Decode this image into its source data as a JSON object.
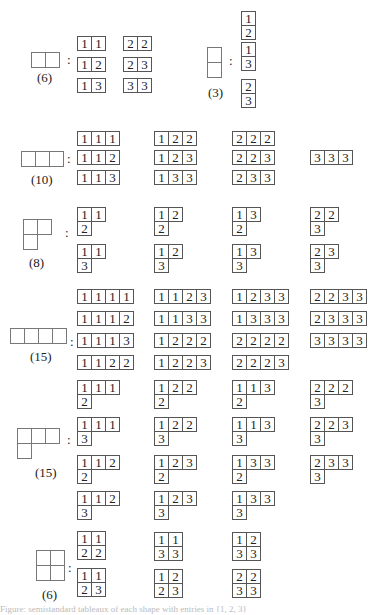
{
  "groups": [
    {
      "id": "shape-2",
      "shape": [
        2
      ],
      "count_label": "(6)",
      "tableaux": [
        [
          [
            "1",
            "1"
          ]
        ],
        [
          [
            "1",
            "2"
          ]
        ],
        [
          [
            "1",
            "3"
          ]
        ],
        [
          [
            "2",
            "2"
          ]
        ],
        [
          [
            "2",
            "3"
          ]
        ],
        [
          [
            "3",
            "3"
          ]
        ]
      ]
    },
    {
      "id": "shape-1-1",
      "shape": [
        1,
        1
      ],
      "count_label": "(3)",
      "tableaux": [
        [
          [
            "1"
          ],
          [
            "2"
          ]
        ],
        [
          [
            "1"
          ],
          [
            "3"
          ]
        ],
        [
          [
            "2"
          ],
          [
            "3"
          ]
        ]
      ]
    },
    {
      "id": "shape-3",
      "shape": [
        3
      ],
      "count_label": "(10)",
      "tableaux": [
        [
          [
            "1",
            "1",
            "1"
          ]
        ],
        [
          [
            "1",
            "1",
            "2"
          ]
        ],
        [
          [
            "1",
            "1",
            "3"
          ]
        ],
        [
          [
            "1",
            "2",
            "2"
          ]
        ],
        [
          [
            "1",
            "2",
            "3"
          ]
        ],
        [
          [
            "1",
            "3",
            "3"
          ]
        ],
        [
          [
            "2",
            "2",
            "2"
          ]
        ],
        [
          [
            "2",
            "2",
            "3"
          ]
        ],
        [
          [
            "2",
            "3",
            "3"
          ]
        ],
        [
          [
            "3",
            "3",
            "3"
          ]
        ]
      ]
    },
    {
      "id": "shape-2-1",
      "shape": [
        2,
        1
      ],
      "count_label": "(8)",
      "tableaux": [
        [
          [
            "1",
            "1"
          ],
          [
            "2"
          ]
        ],
        [
          [
            "1",
            "1"
          ],
          [
            "3"
          ]
        ],
        [
          [
            "1",
            "2"
          ],
          [
            "2"
          ]
        ],
        [
          [
            "1",
            "2"
          ],
          [
            "3"
          ]
        ],
        [
          [
            "1",
            "3"
          ],
          [
            "2"
          ]
        ],
        [
          [
            "1",
            "3"
          ],
          [
            "3"
          ]
        ],
        [
          [
            "2",
            "2"
          ],
          [
            "3"
          ]
        ],
        [
          [
            "2",
            "3"
          ],
          [
            "3"
          ]
        ]
      ]
    },
    {
      "id": "shape-4",
      "shape": [
        4
      ],
      "count_label": "(15)",
      "tableaux": [
        [
          [
            "1",
            "1",
            "1",
            "1"
          ]
        ],
        [
          [
            "1",
            "1",
            "1",
            "2"
          ]
        ],
        [
          [
            "1",
            "1",
            "1",
            "3"
          ]
        ],
        [
          [
            "1",
            "1",
            "2",
            "2"
          ]
        ],
        [
          [
            "1",
            "1",
            "2",
            "3"
          ]
        ],
        [
          [
            "1",
            "1",
            "3",
            "3"
          ]
        ],
        [
          [
            "1",
            "2",
            "2",
            "2"
          ]
        ],
        [
          [
            "1",
            "2",
            "2",
            "3"
          ]
        ],
        [
          [
            "1",
            "2",
            "3",
            "3"
          ]
        ],
        [
          [
            "1",
            "3",
            "3",
            "3"
          ]
        ],
        [
          [
            "2",
            "2",
            "2",
            "2"
          ]
        ],
        [
          [
            "2",
            "2",
            "2",
            "3"
          ]
        ],
        [
          [
            "2",
            "2",
            "3",
            "3"
          ]
        ],
        [
          [
            "2",
            "3",
            "3",
            "3"
          ]
        ],
        [
          [
            "3",
            "3",
            "3",
            "3"
          ]
        ]
      ]
    },
    {
      "id": "shape-3-1",
      "shape": [
        3,
        1
      ],
      "count_label": "(15)",
      "tableaux": [
        [
          [
            "1",
            "1",
            "1"
          ],
          [
            "2"
          ]
        ],
        [
          [
            "1",
            "1",
            "1"
          ],
          [
            "3"
          ]
        ],
        [
          [
            "1",
            "1",
            "2"
          ],
          [
            "2"
          ]
        ],
        [
          [
            "1",
            "1",
            "2"
          ],
          [
            "3"
          ]
        ],
        [
          [
            "1",
            "2",
            "2"
          ],
          [
            "2"
          ]
        ],
        [
          [
            "1",
            "2",
            "2"
          ],
          [
            "3"
          ]
        ],
        [
          [
            "1",
            "2",
            "3"
          ],
          [
            "2"
          ]
        ],
        [
          [
            "1",
            "2",
            "3"
          ],
          [
            "3"
          ]
        ],
        [
          [
            "1",
            "1",
            "3"
          ],
          [
            "2"
          ]
        ],
        [
          [
            "1",
            "1",
            "3"
          ],
          [
            "3"
          ]
        ],
        [
          [
            "1",
            "3",
            "3"
          ],
          [
            "2"
          ]
        ],
        [
          [
            "1",
            "3",
            "3"
          ],
          [
            "3"
          ]
        ],
        [
          [
            "2",
            "2",
            "2"
          ],
          [
            "3"
          ]
        ],
        [
          [
            "2",
            "2",
            "3"
          ],
          [
            "3"
          ]
        ],
        [
          [
            "2",
            "3",
            "3"
          ],
          [
            "3"
          ]
        ]
      ]
    },
    {
      "id": "shape-2-2",
      "shape": [
        2,
        2
      ],
      "count_label": "(6)",
      "tableaux": [
        [
          [
            "1",
            "1"
          ],
          [
            "2",
            "2"
          ]
        ],
        [
          [
            "1",
            "1"
          ],
          [
            "2",
            "3"
          ]
        ],
        [
          [
            "1",
            "1"
          ],
          [
            "3",
            "3"
          ]
        ],
        [
          [
            "1",
            "2"
          ],
          [
            "2",
            "3"
          ]
        ],
        [
          [
            "1",
            "2"
          ],
          [
            "3",
            "3"
          ]
        ],
        [
          [
            "2",
            "2"
          ],
          [
            "3",
            "3"
          ]
        ]
      ]
    }
  ],
  "separator": ":",
  "caption": "Figure: semistandard tableaux of each shape with entries in {1, 2, 3}"
}
